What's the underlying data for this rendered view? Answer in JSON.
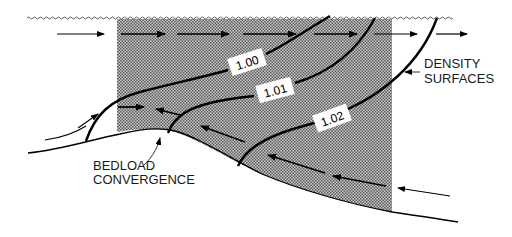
{
  "diagram": {
    "type": "estuarine circulation cross-section",
    "colors": {
      "line": "#000000",
      "shade_dot": "#555555",
      "shade_bg": "#bdbdbd",
      "background": "#ffffff",
      "label_box": "#ffffff"
    },
    "density_surfaces": [
      {
        "label": "1.00"
      },
      {
        "label": "1.01"
      },
      {
        "label": "1.02"
      }
    ],
    "labels": {
      "density_surfaces_line1": "DENSITY",
      "density_surfaces_line2": "SURFACES",
      "bedload_line1": "BEDLOAD",
      "bedload_line2": "CONVERGENCE"
    },
    "elements": {
      "water_surface": "wavy-line",
      "surface_flow": "seaward arrows (left to right)",
      "bottom_flow": "landward arrows (right to left)",
      "turbidity_zone": "stippled shaded region"
    }
  }
}
